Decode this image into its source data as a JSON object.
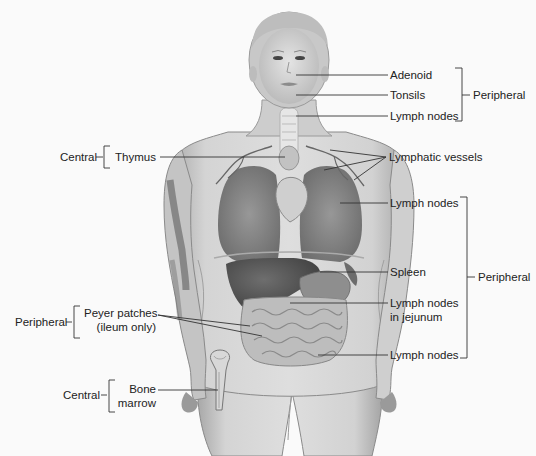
{
  "figure": {
    "colors": {
      "background": "#fafafa",
      "skin": "#d6d6d6",
      "skin_shadow": "#9a9a9a",
      "organ_dark": "#5e5e5e",
      "organ_mid": "#8a8a8a",
      "line": "#333333",
      "text": "#222222"
    }
  },
  "labels": {
    "adenoid": "Adenoid",
    "tonsils": "Tonsils",
    "lymph_nodes_neck": "Lymph nodes",
    "peripheral_head": "Peripheral",
    "lymphatic_vessels": "Lymphatic vessels",
    "thymus": "Thymus",
    "central_thymus": "Central",
    "lymph_nodes_axillary": "Lymph nodes",
    "spleen": "Spleen",
    "lymph_nodes_jejunum_line1": "Lymph nodes",
    "lymph_nodes_jejunum_line2": "in jejunum",
    "lymph_nodes_inguinal": "Lymph nodes",
    "peripheral_body": "Peripheral",
    "peyer_line1": "Peyer patches",
    "peyer_line2": "(ileum only)",
    "peripheral_peyer": "Peripheral",
    "bone_line1": "Bone",
    "bone_line2": "marrow",
    "central_bone": "Central"
  },
  "groups": [
    {
      "category": "Peripheral",
      "members": [
        "Adenoid",
        "Tonsils",
        "Lymph nodes"
      ]
    },
    {
      "category": "Central",
      "members": [
        "Thymus"
      ]
    },
    {
      "category": "Peripheral",
      "members": [
        "Lymph nodes",
        "Spleen",
        "Lymph nodes in jejunum",
        "Lymph nodes"
      ]
    },
    {
      "category": "Peripheral",
      "members": [
        "Peyer patches (ileum only)"
      ]
    },
    {
      "category": "Central",
      "members": [
        "Bone marrow"
      ]
    }
  ]
}
